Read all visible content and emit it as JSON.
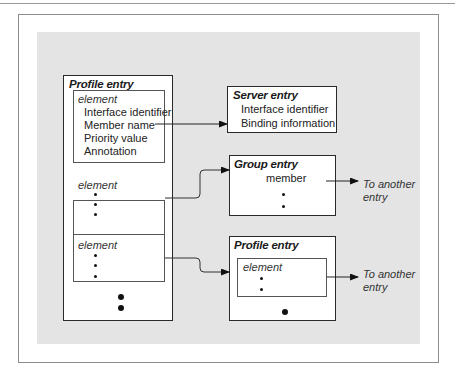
{
  "diagram": {
    "profile_entry": {
      "title": "Profile entry",
      "elements": [
        {
          "label": "element",
          "fields": [
            "Interface identifier",
            "Member name",
            "Priority value",
            "Annotation"
          ]
        },
        {
          "label": "element"
        },
        {
          "label": "element"
        }
      ]
    },
    "server_entry": {
      "title": "Server entry",
      "fields": [
        "Interface identifier",
        "Binding information"
      ]
    },
    "group_entry": {
      "title": "Group entry",
      "member_label": "member",
      "outgoing_label": "To another entry",
      "outgoing_line1": "To another",
      "outgoing_line2": "entry"
    },
    "profile_entry_2": {
      "title": "Profile entry",
      "element_label": "element",
      "outgoing_line1": "To another",
      "outgoing_line2": "entry"
    },
    "connections": [
      {
        "from": "Member name",
        "to": "Server entry"
      },
      {
        "from": "element 2",
        "to": "Group entry"
      },
      {
        "from": "element 3",
        "to": "Profile entry (2)"
      },
      {
        "from": "Group entry member",
        "to": "To another entry"
      },
      {
        "from": "Profile entry (2) element",
        "to": "To another entry"
      }
    ]
  }
}
